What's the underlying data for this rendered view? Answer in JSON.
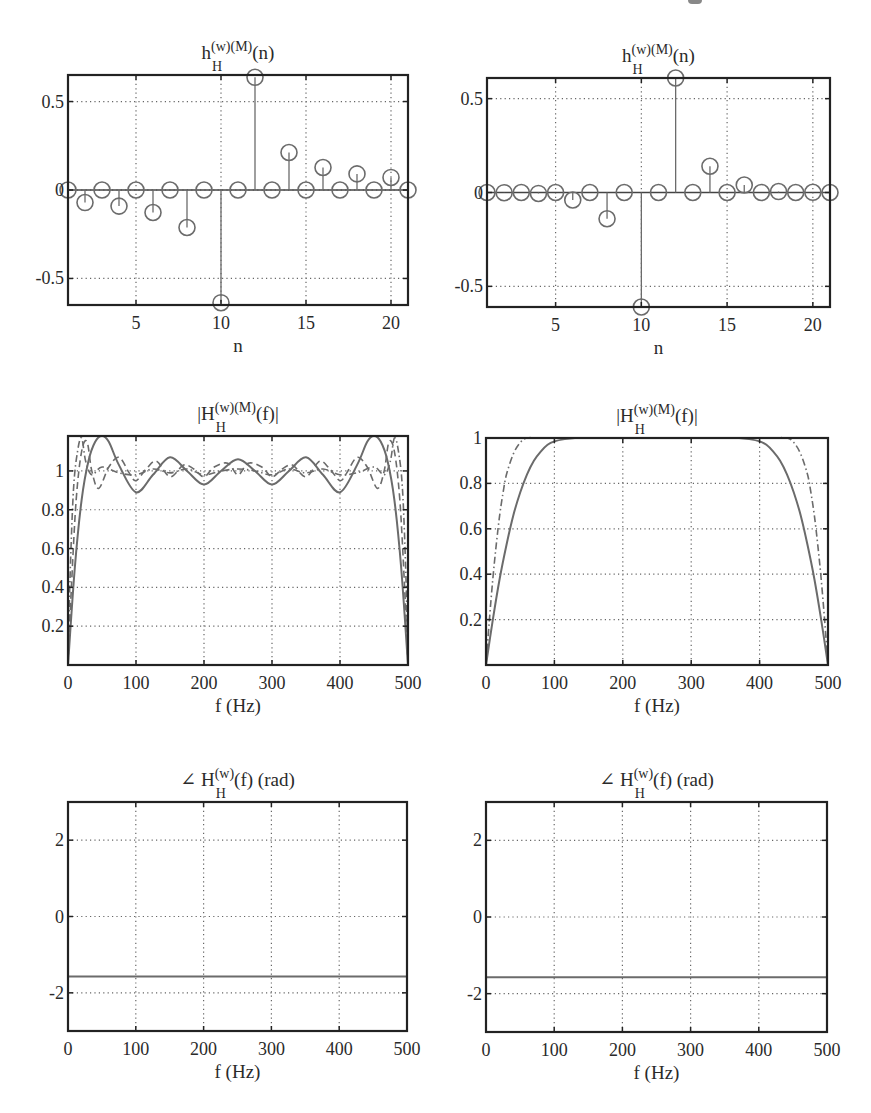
{
  "figure": {
    "colors": {
      "axis": "#222222",
      "grid": "#666666",
      "series": "#6b6b6b",
      "text": "#2a2a2a"
    }
  },
  "chart_data": [
    {
      "id": "impulse-left",
      "type": "stem",
      "title": "h_H^{(w)(M)}(n)",
      "title_parts": {
        "base": "h",
        "sub": "H",
        "sup": "(w)(M)",
        "tail": "(n)"
      },
      "xlabel": "n",
      "ylabel": "",
      "xlim": [
        1,
        21
      ],
      "ylim": [
        -0.65,
        0.65
      ],
      "xticks": [
        5,
        10,
        15,
        20
      ],
      "yticks": [
        -0.5,
        0,
        0.5
      ],
      "ytick_labels": [
        "-0.5",
        "0",
        "0.5"
      ],
      "grid": true,
      "frame": {
        "x": 68,
        "y": 75,
        "w": 340,
        "h": 230
      },
      "x": [
        1,
        2,
        3,
        4,
        5,
        6,
        7,
        8,
        9,
        10,
        11,
        12,
        13,
        14,
        15,
        16,
        17,
        18,
        19,
        20,
        21
      ],
      "values": [
        0,
        -0.071,
        0,
        -0.091,
        0,
        -0.127,
        0,
        -0.212,
        0,
        -0.637,
        0,
        0.637,
        0,
        0.212,
        0,
        0.127,
        0,
        0.091,
        0,
        0.071,
        0
      ]
    },
    {
      "id": "impulse-right",
      "type": "stem",
      "title": "h_H^{(w)(M)}(n)",
      "title_parts": {
        "base": "h",
        "sub": "H",
        "sup": "(w)(M)",
        "tail": "(n)"
      },
      "xlabel": "n",
      "ylabel": "",
      "xlim": [
        1,
        21
      ],
      "ylim": [
        -0.61,
        0.61
      ],
      "xticks": [
        5,
        10,
        15,
        20
      ],
      "yticks": [
        -0.5,
        0,
        0.5
      ],
      "ytick_labels": [
        "-0.5",
        "0",
        "0.5"
      ],
      "grid": true,
      "frame": {
        "x": 487,
        "y": 78,
        "w": 343,
        "h": 229
      },
      "x": [
        1,
        2,
        3,
        4,
        5,
        6,
        7,
        8,
        9,
        10,
        11,
        12,
        13,
        14,
        15,
        16,
        17,
        18,
        19,
        20,
        21
      ],
      "values": [
        0,
        -0.001,
        0,
        -0.005,
        0,
        -0.04,
        0,
        -0.14,
        0,
        -0.61,
        0,
        0.61,
        0,
        0.14,
        0,
        0.04,
        0,
        0.005,
        0,
        0.001,
        0
      ]
    },
    {
      "id": "magnitude-left",
      "type": "line",
      "title": "|H_H^{(w)(M)}(f)|",
      "title_parts": {
        "base": "|H",
        "sub": "H",
        "sup": "(w)(M)",
        "tail": "(f)|"
      },
      "xlabel": "f (Hz)",
      "ylabel": "",
      "xlim": [
        0,
        500
      ],
      "ylim": [
        0,
        1.18
      ],
      "xticks": [
        0,
        100,
        200,
        300,
        400,
        500
      ],
      "yticks": [
        0.2,
        0.4,
        0.6,
        0.8,
        1
      ],
      "ytick_labels": [
        "0.2",
        "0.4",
        "0.6",
        "0.8",
        "1"
      ],
      "grid": true,
      "frame": {
        "x": 68,
        "y": 436,
        "w": 340,
        "h": 229
      },
      "series": [
        {
          "name": "N=21 (solid)",
          "style": "solid",
          "x": [
            0,
            10,
            20,
            30,
            40,
            50,
            60,
            75,
            100,
            125,
            150,
            175,
            200,
            225,
            250,
            275,
            300,
            325,
            350,
            375,
            400,
            425,
            440,
            450,
            460,
            470,
            480,
            490,
            500
          ],
          "values": [
            0,
            0.5,
            0.85,
            1.05,
            1.15,
            1.18,
            1.15,
            1.03,
            0.89,
            0.98,
            1.07,
            1.0,
            0.93,
            1.0,
            1.06,
            1.0,
            0.93,
            1.0,
            1.07,
            0.98,
            0.89,
            1.03,
            1.15,
            1.18,
            1.15,
            1.05,
            0.85,
            0.5,
            0
          ]
        },
        {
          "name": "N=41 (dashed)",
          "style": "dashed",
          "x": [
            0,
            5,
            12,
            20,
            28,
            35,
            45,
            60,
            75,
            90,
            100,
            115,
            130,
            150,
            170,
            185,
            200,
            215,
            235,
            250,
            265,
            285,
            300,
            315,
            330,
            350,
            370,
            385,
            400,
            410,
            425,
            440,
            455,
            465,
            472,
            480,
            488,
            495,
            500
          ],
          "values": [
            0,
            0.4,
            0.85,
            1.1,
            1.15,
            1.0,
            0.91,
            1.02,
            1.07,
            0.99,
            0.95,
            1.01,
            1.05,
            0.97,
            1.03,
            1.01,
            0.97,
            1.02,
            1.04,
            0.98,
            1.04,
            1.02,
            0.97,
            1.01,
            1.03,
            0.97,
            1.05,
            1.01,
            0.95,
            0.99,
            1.07,
            1.02,
            0.91,
            1.0,
            1.15,
            1.1,
            0.85,
            0.4,
            0
          ]
        },
        {
          "name": "N=81 (dash-dot)",
          "style": "dashdot",
          "x": [
            0,
            3,
            8,
            14,
            20,
            26,
            35,
            50,
            75,
            100,
            125,
            150,
            175,
            200,
            225,
            250,
            275,
            300,
            325,
            350,
            375,
            400,
            425,
            450,
            465,
            474,
            480,
            486,
            492,
            497,
            500
          ],
          "values": [
            0,
            0.45,
            0.9,
            1.1,
            1.17,
            1.05,
            0.98,
            1.02,
            0.99,
            0.98,
            1.01,
            0.99,
            1.01,
            0.98,
            1.0,
            1.01,
            1.0,
            0.98,
            1.01,
            0.99,
            1.01,
            0.98,
            0.99,
            1.02,
            0.98,
            1.05,
            1.17,
            1.1,
            0.9,
            0.45,
            0
          ]
        }
      ]
    },
    {
      "id": "magnitude-right",
      "type": "line",
      "title": "|H_H^{(w)(M)}(f)|",
      "title_parts": {
        "base": "|H",
        "sub": "H",
        "sup": "(w)(M)",
        "tail": "(f)|"
      },
      "xlabel": "f (Hz)",
      "ylabel": "",
      "xlim": [
        0,
        500
      ],
      "ylim": [
        0,
        1
      ],
      "xticks": [
        0,
        100,
        200,
        300,
        400,
        500
      ],
      "yticks": [
        0.2,
        0.4,
        0.6,
        0.8,
        1
      ],
      "ytick_labels": [
        "0.2",
        "0.4",
        "0.6",
        "0.8",
        "1"
      ],
      "grid": true,
      "frame": {
        "x": 486,
        "y": 438,
        "w": 342,
        "h": 227
      },
      "series": [
        {
          "name": "N=21 (solid)",
          "style": "solid",
          "x": [
            0,
            10,
            20,
            30,
            40,
            50,
            60,
            70,
            80,
            90,
            100,
            115,
            130,
            150,
            200,
            250,
            300,
            350,
            370,
            385,
            400,
            410,
            420,
            430,
            440,
            450,
            460,
            470,
            480,
            490,
            500
          ],
          "values": [
            0,
            0.2,
            0.38,
            0.53,
            0.66,
            0.76,
            0.84,
            0.9,
            0.94,
            0.97,
            0.985,
            0.995,
            1.0,
            1.0,
            1.0,
            1.0,
            1.0,
            1.0,
            1.0,
            0.995,
            0.985,
            0.97,
            0.94,
            0.9,
            0.84,
            0.76,
            0.66,
            0.53,
            0.38,
            0.2,
            0
          ]
        },
        {
          "name": "N=41 (dash-dot)",
          "style": "dashdot",
          "x": [
            0,
            5,
            10,
            15,
            20,
            25,
            30,
            40,
            50,
            60,
            80,
            100,
            200,
            300,
            400,
            420,
            440,
            450,
            460,
            470,
            475,
            480,
            485,
            490,
            495,
            500
          ],
          "values": [
            0,
            0.2,
            0.38,
            0.53,
            0.66,
            0.76,
            0.84,
            0.93,
            0.98,
            1.0,
            1.0,
            1.0,
            1.0,
            1.0,
            1.0,
            1.0,
            1.0,
            0.98,
            0.93,
            0.84,
            0.76,
            0.66,
            0.53,
            0.38,
            0.2,
            0
          ]
        }
      ]
    },
    {
      "id": "phase-left",
      "type": "line",
      "title": "∠ H_H^{(w)}(f) (rad)",
      "title_parts": {
        "base": "∠ H",
        "sub": "H",
        "sup": "(w)",
        "tail": "(f) (rad)"
      },
      "xlabel": "f (Hz)",
      "ylabel": "",
      "xlim": [
        0,
        500
      ],
      "ylim": [
        -3,
        3
      ],
      "xticks": [
        0,
        100,
        200,
        300,
        400,
        500
      ],
      "yticks": [
        -2,
        0,
        2
      ],
      "ytick_labels": [
        "-2",
        "0",
        "2"
      ],
      "grid": true,
      "frame": {
        "x": 68,
        "y": 802,
        "w": 339,
        "h": 229
      },
      "series": [
        {
          "name": "phase",
          "style": "solid",
          "x": [
            0,
            500
          ],
          "values": [
            -1.5708,
            -1.5708
          ]
        }
      ]
    },
    {
      "id": "phase-right",
      "type": "line",
      "title": "∠ H_H^{(w)}(f) (rad)",
      "title_parts": {
        "base": "∠ H",
        "sub": "H",
        "sup": "(w)",
        "tail": "(f) (rad)"
      },
      "xlabel": "f (Hz)",
      "ylabel": "",
      "xlim": [
        0,
        500
      ],
      "ylim": [
        -3,
        3
      ],
      "xticks": [
        0,
        100,
        200,
        300,
        400,
        500
      ],
      "yticks": [
        -2,
        0,
        2
      ],
      "ytick_labels": [
        "-2",
        "0",
        "2"
      ],
      "grid": true,
      "frame": {
        "x": 486,
        "y": 802,
        "w": 341,
        "h": 230
      },
      "series": [
        {
          "name": "phase",
          "style": "solid",
          "x": [
            0,
            500
          ],
          "values": [
            -1.5708,
            -1.5708
          ]
        }
      ]
    }
  ]
}
